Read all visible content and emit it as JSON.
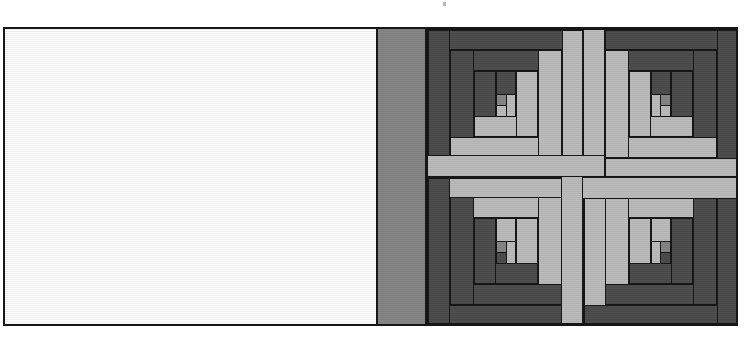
{
  "figure": {
    "title": "Log Cabin Pinwheel Quilt Block Diagram",
    "caption": "",
    "background_color": "#ffffff",
    "outline_color": "#171717",
    "width": 745,
    "height": 337
  },
  "palette": {
    "dark": "#4d4d4d",
    "medium": "#868686",
    "light": "#bcbcbc",
    "white": "#fdfdfd",
    "outline": "#171717"
  },
  "panels": {
    "plain_panel": {
      "name": "plain white panel",
      "fill": "white"
    },
    "sashing_band": {
      "name": "vertical sashing strip",
      "fill": "medium"
    },
    "quilt_panel": {
      "name": "four log cabin blocks set in a pinwheel",
      "fill": "dark"
    }
  },
  "blocks": [
    {
      "position": "top-left",
      "name": "log-cabin-block-top-left",
      "dark_side": "upper-left",
      "light_side": "lower-right"
    },
    {
      "position": "top-right",
      "name": "log-cabin-block-top-right",
      "dark_side": "upper-right",
      "light_side": "lower-left"
    },
    {
      "position": "bottom-left",
      "name": "log-cabin-block-bottom-left",
      "dark_side": "lower-left",
      "light_side": "upper-right"
    },
    {
      "position": "bottom-right",
      "name": "log-cabin-block-bottom-right",
      "dark_side": "lower-right",
      "light_side": "upper-left"
    }
  ],
  "center": {
    "name": "pinwheel center",
    "strip_count": 4,
    "strip_fill": "light"
  },
  "labels": {
    "plain_panel": "",
    "sashing_band": "",
    "quilt_panel": ""
  }
}
